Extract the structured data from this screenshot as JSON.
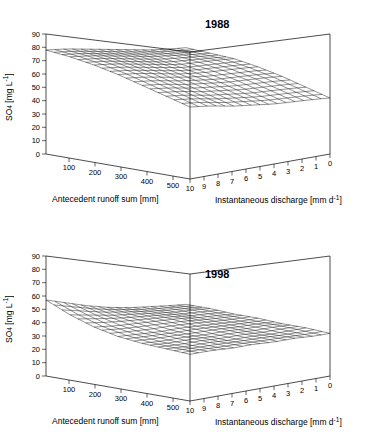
{
  "figure": {
    "panels": [
      {
        "id": "panel-1988",
        "year_label": "1988",
        "ylabel_main": "SO",
        "ylabel_sub": "4",
        "ylabel_unit": " [mg L",
        "ylabel_sup": "-1",
        "ylabel_close": "]",
        "xlabel_left": "Antecedent runoff sum [mm]",
        "xlabel_right_main": "Instantaneous discharge [mm d",
        "xlabel_right_sup": "-1",
        "xlabel_right_close": "]"
      },
      {
        "id": "panel-1998",
        "year_label": "1998",
        "ylabel_main": "SO",
        "ylabel_sub": "4",
        "ylabel_unit": " [mg L",
        "ylabel_sup": "-1",
        "ylabel_close": "]",
        "xlabel_left": "Antecedent runoff sum [mm]",
        "xlabel_right_main": "Instantaneous discharge [mm d",
        "xlabel_right_sup": "-1",
        "xlabel_right_close": "]"
      }
    ]
  },
  "chart_data": [
    {
      "type": "surface",
      "title": "1988",
      "zlabel": "SO4 [mg L-1]",
      "xlabel": "Antecedent runoff sum [mm]",
      "ylabel": "Instantaneous discharge [mm d-1]",
      "zlim": [
        0,
        90
      ],
      "zticks": [
        0,
        10,
        20,
        30,
        40,
        50,
        60,
        70,
        80,
        90
      ],
      "xticks": [
        100,
        200,
        300,
        400,
        500
      ],
      "yticks": [
        10,
        9,
        8,
        7,
        6,
        5,
        4,
        3,
        2,
        1,
        0
      ],
      "grid": false,
      "mesh": {
        "x": [
          50,
          130,
          210,
          290,
          370,
          450,
          530
        ],
        "y": [
          10,
          8.5,
          7,
          5.5,
          4,
          2.5,
          1,
          0
        ],
        "z": [
          [
            78,
            76,
            73,
            69,
            64,
            59,
            54
          ],
          [
            76,
            74,
            71,
            67,
            62,
            57,
            52
          ],
          [
            73,
            71,
            68,
            64,
            59,
            54,
            49
          ],
          [
            70,
            68,
            65,
            61,
            57,
            52,
            47
          ],
          [
            67,
            65,
            62,
            59,
            55,
            50,
            45
          ],
          [
            64,
            63,
            61,
            58,
            54,
            49,
            44
          ],
          [
            62,
            61,
            60,
            57,
            53,
            48,
            43
          ],
          [
            61,
            60,
            59,
            56,
            52,
            47,
            42
          ]
        ]
      }
    },
    {
      "type": "surface",
      "title": "1998",
      "zlabel": "SO4 [mg L-1]",
      "xlabel": "Antecedent runoff sum [mm]",
      "ylabel": "Instantaneous discharge [mm d-1]",
      "zlim": [
        0,
        90
      ],
      "zticks": [
        0,
        10,
        20,
        30,
        40,
        50,
        60,
        70,
        80,
        90
      ],
      "xticks": [
        100,
        200,
        300,
        400,
        500
      ],
      "yticks": [
        10,
        9,
        8,
        7,
        6,
        5,
        4,
        3,
        2,
        1,
        0
      ],
      "grid": false,
      "mesh": {
        "x": [
          50,
          130,
          210,
          290,
          370,
          450,
          530
        ],
        "y": [
          10,
          8.5,
          7,
          5.5,
          4,
          2.5,
          1,
          0
        ],
        "z": [
          [
            57,
            49,
            43,
            39,
            37,
            36,
            35
          ],
          [
            52,
            46,
            41,
            38,
            36,
            35,
            35
          ],
          [
            47,
            43,
            40,
            37,
            36,
            35,
            34
          ],
          [
            43,
            41,
            39,
            37,
            35,
            34,
            34
          ],
          [
            40,
            39,
            38,
            36,
            35,
            34,
            33
          ],
          [
            38,
            37,
            36,
            35,
            34,
            33,
            33
          ],
          [
            36,
            36,
            35,
            34,
            34,
            33,
            32
          ],
          [
            35,
            35,
            34,
            34,
            33,
            33,
            32
          ]
        ]
      }
    }
  ]
}
